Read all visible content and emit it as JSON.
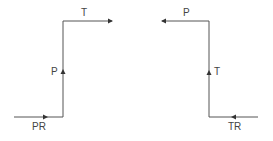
{
  "diagram": {
    "left_path": {
      "segments": [
        "PR",
        "P",
        "T"
      ],
      "labels": {
        "entry": "PR",
        "vertical": "P",
        "exit": "T"
      }
    },
    "right_path": {
      "segments": [
        "TR",
        "T",
        "P"
      ],
      "labels": {
        "entry": "TR",
        "vertical": "T",
        "exit": "P"
      }
    },
    "line_color": "#444444"
  }
}
